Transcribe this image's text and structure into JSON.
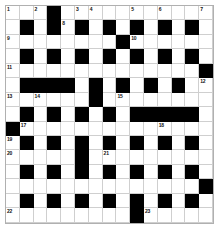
{
  "puzzle": {
    "title": "Crossword Grid",
    "rows": 15,
    "columns": 15,
    "cell_size_px": 13.8,
    "colors": {
      "block": "#000000",
      "cell": "#ffffff",
      "gridline": "#cfcfcf",
      "border": "#b0b0b0",
      "number_text": "#111111"
    },
    "grid": [
      "...#...........",
      ".#.#.#.#.#.#.#.",
      "........#......",
      ".#.#.#.#.#.#.#.",
      "..............#",
      ".####.#.#.#.#..",
      "......#........",
      ".#.#.#.#.#####.",
      "#..............",
      ".#.#.#.#.#.#.#.",
      ".....#.........",
      ".#.#.#.#.#.#.#.",
      "..............#",
      ".#.#.#.#.#.#.#.",
      ".........#....."
    ],
    "numbers": [
      {
        "row": 0,
        "col": 0,
        "label": "1"
      },
      {
        "row": 0,
        "col": 2,
        "label": "2"
      },
      {
        "row": 0,
        "col": 5,
        "label": "3"
      },
      {
        "row": 0,
        "col": 6,
        "label": "4"
      },
      {
        "row": 0,
        "col": 9,
        "label": "5"
      },
      {
        "row": 0,
        "col": 11,
        "label": "6"
      },
      {
        "row": 0,
        "col": 14,
        "label": "7"
      },
      {
        "row": 1,
        "col": 4,
        "label": "8"
      },
      {
        "row": 2,
        "col": 0,
        "label": "9"
      },
      {
        "row": 2,
        "col": 9,
        "label": "10"
      },
      {
        "row": 4,
        "col": 0,
        "label": "11"
      },
      {
        "row": 5,
        "col": 14,
        "label": "12"
      },
      {
        "row": 6,
        "col": 0,
        "label": "13"
      },
      {
        "row": 6,
        "col": 2,
        "label": "14"
      },
      {
        "row": 6,
        "col": 8,
        "label": "15"
      },
      {
        "row": 7,
        "col": 7,
        "label": "16"
      },
      {
        "row": 8,
        "col": 1,
        "label": "17"
      },
      {
        "row": 8,
        "col": 11,
        "label": "18"
      },
      {
        "row": 9,
        "col": 0,
        "label": "19"
      },
      {
        "row": 10,
        "col": 0,
        "label": "20"
      },
      {
        "row": 10,
        "col": 7,
        "label": "21"
      },
      {
        "row": 14,
        "col": 0,
        "label": "22"
      },
      {
        "row": 14,
        "col": 10,
        "label": "23"
      }
    ],
    "entries": []
  }
}
